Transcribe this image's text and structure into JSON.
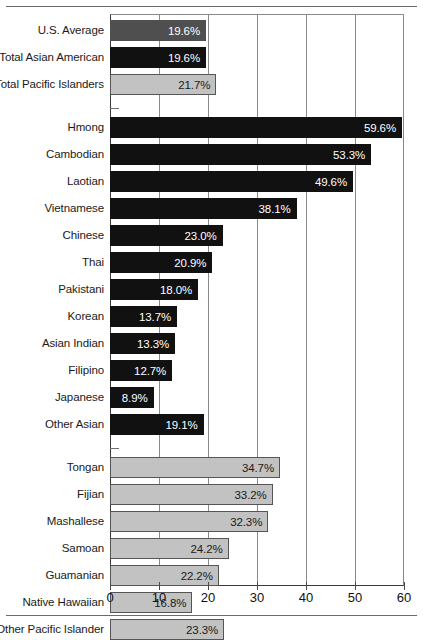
{
  "chart_data": {
    "type": "bar",
    "orientation": "horizontal",
    "title": "",
    "subtitle": "",
    "xlabel": "",
    "ylabel": "",
    "xlim": [
      0,
      60
    ],
    "xticks": [
      0,
      10,
      20,
      30,
      40,
      50,
      60
    ],
    "xtick_labels": [
      "0",
      "10",
      "20",
      "30",
      "40",
      "50",
      "60"
    ],
    "grid": true,
    "grid_axis": "x",
    "legend": "none",
    "value_suffix": "%",
    "groups": [
      {
        "name": "summary",
        "style": "mixed",
        "items": [
          {
            "label": "U.S. Average",
            "value": 19.6,
            "value_label": "19.6%",
            "style": "medium"
          },
          {
            "label": "Total Asian American",
            "value": 19.6,
            "value_label": "19.6%",
            "style": "dark"
          },
          {
            "label": "Total Pacific Islanders",
            "value": 21.7,
            "value_label": "21.7%",
            "style": "light"
          }
        ]
      },
      {
        "name": "asian-american-detail",
        "style": "dark",
        "items": [
          {
            "label": "Hmong",
            "value": 59.6,
            "value_label": "59.6%",
            "style": "dark"
          },
          {
            "label": "Cambodian",
            "value": 53.3,
            "value_label": "53.3%",
            "style": "dark"
          },
          {
            "label": "Laotian",
            "value": 49.6,
            "value_label": "49.6%",
            "style": "dark"
          },
          {
            "label": "Vietnamese",
            "value": 38.1,
            "value_label": "38.1%",
            "style": "dark"
          },
          {
            "label": "Chinese",
            "value": 23.0,
            "value_label": "23.0%",
            "style": "dark"
          },
          {
            "label": "Thai",
            "value": 20.9,
            "value_label": "20.9%",
            "style": "dark"
          },
          {
            "label": "Pakistani",
            "value": 18.0,
            "value_label": "18.0%",
            "style": "dark"
          },
          {
            "label": "Korean",
            "value": 13.7,
            "value_label": "13.7%",
            "style": "dark"
          },
          {
            "label": "Asian Indian",
            "value": 13.3,
            "value_label": "13.3%",
            "style": "dark"
          },
          {
            "label": "Filipino",
            "value": 12.7,
            "value_label": "12.7%",
            "style": "dark"
          },
          {
            "label": "Japanese",
            "value": 8.9,
            "value_label": "8.9%",
            "style": "dark"
          },
          {
            "label": "Other Asian",
            "value": 19.1,
            "value_label": "19.1%",
            "style": "dark"
          }
        ]
      },
      {
        "name": "pacific-islander-detail",
        "style": "light",
        "items": [
          {
            "label": "Tongan",
            "value": 34.7,
            "value_label": "34.7%",
            "style": "light"
          },
          {
            "label": "Fijian",
            "value": 33.2,
            "value_label": "33.2%",
            "style": "light"
          },
          {
            "label": "Mashallese",
            "value": 32.3,
            "value_label": "32.3%",
            "style": "light"
          },
          {
            "label": "Samoan",
            "value": 24.2,
            "value_label": "24.2%",
            "style": "light"
          },
          {
            "label": "Guamanian",
            "value": 22.2,
            "value_label": "22.2%",
            "style": "light"
          },
          {
            "label": "Native Hawaiian",
            "value": 16.8,
            "value_label": "16.8%",
            "style": "light"
          },
          {
            "label": "Other Pacific Islander",
            "value": 23.3,
            "value_label": "23.3%",
            "style": "light"
          }
        ]
      }
    ],
    "colors": {
      "dark": "#111111",
      "medium": "#4f4f4f",
      "light": "#c2c2c2",
      "light_border": "#555555",
      "gridline": "#8a8a8a",
      "axis": "#3a3a3a",
      "rule": "#6b6b6b",
      "text": "#1a1a1a",
      "value_text_on_dark": "#ffffff",
      "value_text_on_light": "#1a1a1a",
      "background": "#ffffff"
    }
  }
}
